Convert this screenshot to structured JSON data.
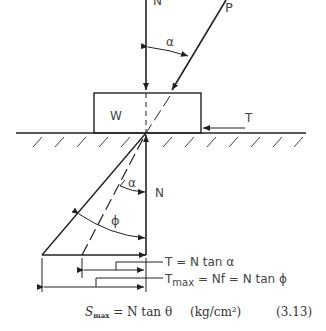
{
  "diagram": {
    "labels": {
      "N_top": "N",
      "P": "P",
      "alpha_top": "α",
      "W": "W",
      "T": "T",
      "alpha_bottom": "α",
      "N_bottom": "N",
      "phi": "ϕ"
    },
    "annotations": {
      "t_eq": "T = N tan α",
      "tmax_prefix": "T",
      "tmax_sub": "max",
      "tmax_rest": " = Nf = N tan ϕ"
    },
    "equation": {
      "lhs": "S",
      "lhs_sub": "max",
      "rhs": " = N tan θ",
      "units": "(kg/cm²)",
      "number": "(3.13)"
    }
  }
}
